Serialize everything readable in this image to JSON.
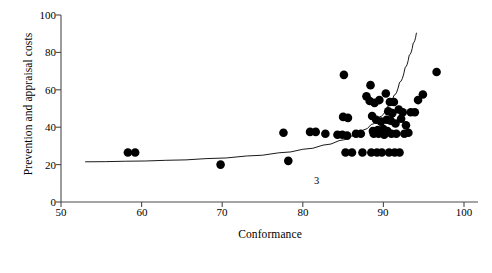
{
  "chart_data": {
    "type": "scatter",
    "title": "",
    "xlabel": "Conformance",
    "ylabel": "Prevention and appraisal costs",
    "xlim": [
      50,
      100
    ],
    "ylim": [
      0,
      100
    ],
    "xticks": [
      50,
      60,
      70,
      80,
      90,
      100
    ],
    "yticks": [
      0,
      20,
      40,
      60,
      80,
      100
    ],
    "grid": false,
    "legend": null,
    "annotations": [
      {
        "text": "3",
        "x": 81.9,
        "y": 10.5
      }
    ],
    "series": [
      {
        "name": "Observations",
        "marker": "filled-circle",
        "color": "#000000",
        "points": [
          [
            58.3,
            26.5
          ],
          [
            59.2,
            26.5
          ],
          [
            69.8,
            20.0
          ],
          [
            77.6,
            37.0
          ],
          [
            78.2,
            22.0
          ],
          [
            80.9,
            37.5
          ],
          [
            81.6,
            37.5
          ],
          [
            82.8,
            36.5
          ],
          [
            84.3,
            36.0
          ],
          [
            84.9,
            36.0
          ],
          [
            85.5,
            35.5
          ],
          [
            85.1,
            68.0
          ],
          [
            85.0,
            45.5
          ],
          [
            85.6,
            45.0
          ],
          [
            85.3,
            26.5
          ],
          [
            86.1,
            26.5
          ],
          [
            86.6,
            36.5
          ],
          [
            87.2,
            36.5
          ],
          [
            87.4,
            26.5
          ],
          [
            87.9,
            56.5
          ],
          [
            88.4,
            62.5
          ],
          [
            88.3,
            54.0
          ],
          [
            88.9,
            53.0
          ],
          [
            89.5,
            54.5
          ],
          [
            88.6,
            46.0
          ],
          [
            89.1,
            44.0
          ],
          [
            89.7,
            43.0
          ],
          [
            88.7,
            38.0
          ],
          [
            89.3,
            38.5
          ],
          [
            90.0,
            39.0
          ],
          [
            88.8,
            36.5
          ],
          [
            89.4,
            36.5
          ],
          [
            90.1,
            36.0
          ],
          [
            88.5,
            26.5
          ],
          [
            89.2,
            26.5
          ],
          [
            89.8,
            26.5
          ],
          [
            90.3,
            58.0
          ],
          [
            90.8,
            53.5
          ],
          [
            91.3,
            53.5
          ],
          [
            90.6,
            48.5
          ],
          [
            91.1,
            47.5
          ],
          [
            90.4,
            44.0
          ],
          [
            90.9,
            43.5
          ],
          [
            91.5,
            42.0
          ],
          [
            90.5,
            38.0
          ],
          [
            91.0,
            36.5
          ],
          [
            91.6,
            36.5
          ],
          [
            90.7,
            26.5
          ],
          [
            91.4,
            26.5
          ],
          [
            92.0,
            26.5
          ],
          [
            91.9,
            49.5
          ],
          [
            92.4,
            48.0
          ],
          [
            92.2,
            44.5
          ],
          [
            92.8,
            41.0
          ],
          [
            92.6,
            36.5
          ],
          [
            93.1,
            37.0
          ],
          [
            93.4,
            48.0
          ],
          [
            93.9,
            48.0
          ],
          [
            94.3,
            54.5
          ],
          [
            94.9,
            57.5
          ],
          [
            96.6,
            69.5
          ]
        ]
      },
      {
        "name": "Fitted curve",
        "type": "line",
        "color": "#000000",
        "x": [
          53.0,
          58.0,
          63.0,
          68.0,
          73.0,
          77.0,
          80.0,
          82.5,
          84.5,
          86.0,
          87.5,
          88.5,
          89.5,
          90.5,
          91.3,
          92.0,
          92.7,
          93.2,
          93.7,
          94.1
        ],
        "y": [
          21.5,
          21.8,
          22.3,
          23.2,
          24.6,
          26.3,
          28.2,
          30.4,
          32.8,
          35.2,
          38.5,
          41.5,
          45.5,
          51.0,
          57.0,
          64.0,
          72.0,
          78.5,
          85.0,
          90.5
        ]
      }
    ]
  },
  "axis": {
    "y_tick_labels": [
      "100",
      "80",
      "60",
      "40",
      "20",
      "0"
    ],
    "x_tick_labels": [
      "50",
      "60",
      "70",
      "80",
      "90",
      "100"
    ],
    "y_title": "Prevention and appraisal costs",
    "x_title": "Conformance"
  }
}
